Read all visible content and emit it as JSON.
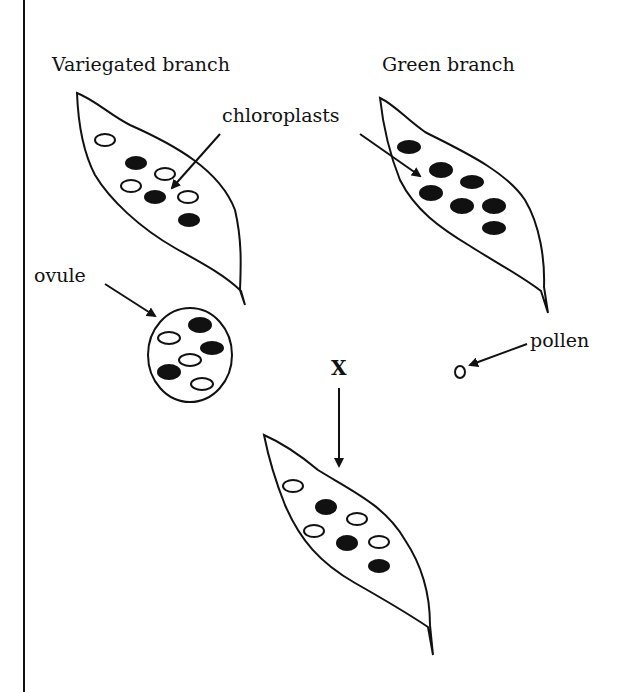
{
  "diagram": {
    "type": "biology-inheritance",
    "labels": {
      "variegated_branch": "Variegated branch",
      "green_branch": "Green branch",
      "chloroplasts": "chloroplasts",
      "ovule": "ovule",
      "pollen": "pollen",
      "cross": "X"
    },
    "elements": {
      "variegated_leaf": {
        "chloroplasts": {
          "white": 4,
          "black": 3
        }
      },
      "green_leaf": {
        "chloroplasts": {
          "white": 0,
          "black": 7
        }
      },
      "ovule": {
        "chloroplasts": {
          "white": 3,
          "black": 3
        }
      },
      "pollen": {
        "chloroplasts": {
          "white": 0,
          "black": 0
        }
      },
      "offspring_leaf": {
        "chloroplasts": {
          "white": 4,
          "black": 3
        }
      }
    },
    "colors": {
      "stroke": "#111111",
      "background": "#ffffff"
    }
  }
}
